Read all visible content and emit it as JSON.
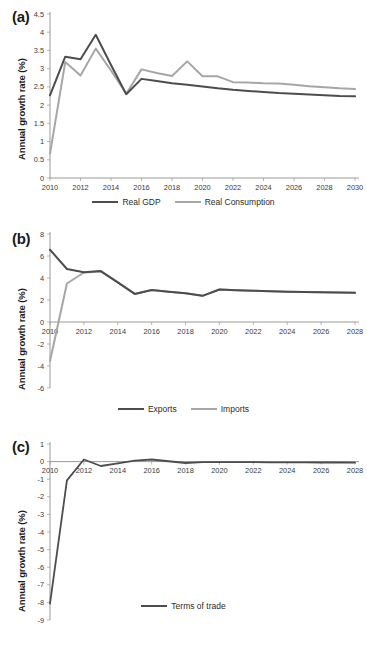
{
  "figure": {
    "background": "#ffffff",
    "colors": {
      "dark": "#4d4d4d",
      "light": "#a6a6a6",
      "axis": "#808080",
      "text": "#231f20"
    }
  },
  "panels": [
    {
      "id": "a",
      "label": "(a)"
    },
    {
      "id": "b",
      "label": "(b)"
    },
    {
      "id": "c",
      "label": "(c)"
    }
  ],
  "chart_data": [
    {
      "type": "line",
      "panel": "(a)",
      "title": "",
      "xlabel": "",
      "ylabel": "Annual growth rate (%)",
      "xlim": [
        2010,
        2030
      ],
      "ylim": [
        0,
        4.5
      ],
      "ytick_step": 0.5,
      "xtick_step": 2,
      "grid": false,
      "legend_position": "bottom",
      "yticks": [
        "0",
        "0.5",
        "1",
        "1.5",
        "2",
        "2.5",
        "3",
        "3.5",
        "4",
        "4.5"
      ],
      "xticks": [
        "2010",
        "2012",
        "2014",
        "2016",
        "2018",
        "2020",
        "2022",
        "2024",
        "2026",
        "2028",
        "2030"
      ],
      "x": [
        2010,
        2011,
        2012,
        2013,
        2014,
        2015,
        2016,
        2017,
        2018,
        2019,
        2020,
        2021,
        2022,
        2023,
        2024,
        2025,
        2026,
        2027,
        2028,
        2029,
        2030
      ],
      "series": [
        {
          "name": "Real GDP",
          "color": "#4d4d4d",
          "values": [
            2.27,
            3.33,
            3.26,
            3.93,
            3.1,
            2.3,
            2.72,
            2.66,
            2.6,
            2.56,
            2.51,
            2.46,
            2.42,
            2.39,
            2.36,
            2.33,
            2.31,
            2.29,
            2.27,
            2.25,
            2.24
          ]
        },
        {
          "name": "Real Consumption",
          "color": "#a6a6a6",
          "values": [
            0.67,
            3.18,
            2.81,
            3.55,
            2.95,
            2.31,
            2.98,
            2.88,
            2.8,
            3.2,
            2.79,
            2.79,
            2.63,
            2.62,
            2.6,
            2.59,
            2.56,
            2.52,
            2.49,
            2.46,
            2.44
          ]
        }
      ]
    },
    {
      "type": "line",
      "panel": "(b)",
      "title": "",
      "xlabel": "",
      "ylabel": "Annual growth rate (%)",
      "xlim": [
        2010,
        2028
      ],
      "ylim": [
        -6,
        8
      ],
      "ytick_step": 2,
      "xtick_step": 2,
      "grid": false,
      "legend_position": "bottom",
      "yticks": [
        "-6",
        "-4",
        "-2",
        "0",
        "2",
        "4",
        "6",
        "8"
      ],
      "xticks": [
        "2010",
        "2012",
        "2014",
        "2016",
        "2018",
        "2020",
        "2022",
        "2024",
        "2026",
        "2028"
      ],
      "x": [
        2010,
        2011,
        2012,
        2013,
        2014,
        2015,
        2016,
        2017,
        2018,
        2019,
        2020,
        2021,
        2022,
        2023,
        2024,
        2025,
        2026,
        2027,
        2028
      ],
      "series": [
        {
          "name": "Exports",
          "color": "#4d4d4d",
          "values": [
            6.57,
            4.82,
            4.52,
            4.63,
            3.6,
            2.55,
            2.9,
            2.75,
            2.62,
            2.38,
            2.95,
            2.88,
            2.84,
            2.8,
            2.76,
            2.73,
            2.7,
            2.68,
            2.66
          ]
        },
        {
          "name": "Imports",
          "color": "#a6a6a6",
          "values": [
            -3.55,
            3.5,
            4.5,
            4.6,
            3.6,
            2.55,
            2.9,
            2.75,
            2.62,
            2.38,
            2.95,
            2.88,
            2.84,
            2.8,
            2.76,
            2.73,
            2.7,
            2.68,
            2.66
          ]
        }
      ]
    },
    {
      "type": "line",
      "panel": "(c)",
      "title": "",
      "xlabel": "",
      "ylabel": "Annual growth rate (%)",
      "xlim": [
        2010,
        2028
      ],
      "ylim": [
        -9,
        1
      ],
      "ytick_step": 1,
      "xtick_step": 2,
      "grid": false,
      "legend_position": "bottom",
      "yticks": [
        "-9",
        "-8",
        "-7",
        "-6",
        "-5",
        "-4",
        "-3",
        "-2",
        "-1",
        "0",
        "1"
      ],
      "xticks": [
        "2010",
        "2012",
        "2014",
        "2016",
        "2018",
        "2020",
        "2022",
        "2024",
        "2026",
        "2028"
      ],
      "x": [
        2010,
        2011,
        2012,
        2013,
        2014,
        2015,
        2016,
        2017,
        2018,
        2019,
        2020,
        2021,
        2022,
        2023,
        2024,
        2025,
        2026,
        2027,
        2028
      ],
      "series": [
        {
          "name": "Terms of trade",
          "color": "#4d4d4d",
          "values": [
            -8.07,
            -1.07,
            0.12,
            -0.25,
            -0.1,
            0.05,
            0.12,
            0.02,
            -0.08,
            -0.03,
            -0.03,
            -0.03,
            -0.03,
            -0.04,
            -0.04,
            -0.04,
            -0.05,
            -0.05,
            -0.06
          ]
        }
      ]
    }
  ]
}
